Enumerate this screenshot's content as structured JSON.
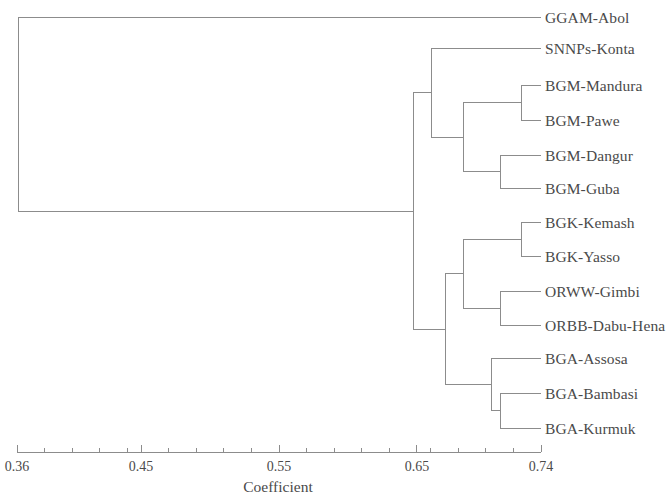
{
  "chart_data": {
    "type": "dendrogram",
    "title": "",
    "xlabel": "Coefficient",
    "ylabel": "",
    "xlim": [
      0.36,
      0.74
    ],
    "grid": false,
    "legend": null,
    "axis": {
      "tick_labels": [
        "0.36",
        "0.45",
        "0.55",
        "0.65",
        "0.74"
      ],
      "tick_values": [
        0.36,
        0.45,
        0.55,
        0.65,
        0.74
      ],
      "minor_tick_values": [
        0.38,
        0.4,
        0.42,
        0.44,
        0.47,
        0.49,
        0.51,
        0.53,
        0.57,
        0.59,
        0.61,
        0.63,
        0.66,
        0.68,
        0.7,
        0.72
      ],
      "orientation": "bottom",
      "direction": "left-to-right-increasing"
    },
    "leaves": [
      {
        "label": "GGAM-Abol",
        "row": 0,
        "tip_coefficient": 0.74
      },
      {
        "label": "SNNPs-Konta",
        "row": 1,
        "tip_coefficient": 0.74
      },
      {
        "label": "BGM-Mandura",
        "row": 2,
        "tip_coefficient": 0.74
      },
      {
        "label": "BGM-Pawe",
        "row": 3,
        "tip_coefficient": 0.74
      },
      {
        "label": "BGM-Dangur",
        "row": 4,
        "tip_coefficient": 0.74
      },
      {
        "label": "BGM-Guba",
        "row": 5,
        "tip_coefficient": 0.74
      },
      {
        "label": "BGK-Kemash",
        "row": 6,
        "tip_coefficient": 0.74
      },
      {
        "label": "BGK-Yasso",
        "row": 7,
        "tip_coefficient": 0.74
      },
      {
        "label": "ORWW-Gimbi",
        "row": 8,
        "tip_coefficient": 0.74
      },
      {
        "label": "ORBB-Dabu-Hena",
        "row": 9,
        "tip_coefficient": 0.74
      },
      {
        "label": "BGA-Assosa",
        "row": 10,
        "tip_coefficient": 0.74
      },
      {
        "label": "BGA-Bambasi",
        "row": 11,
        "tip_coefficient": 0.74
      },
      {
        "label": "BGA-Kurmuk",
        "row": 12,
        "tip_coefficient": 0.74
      }
    ],
    "merges": [
      {
        "id": "n1",
        "coefficient": 0.736,
        "children": [
          "BGM-Mandura",
          "BGM-Pawe"
        ]
      },
      {
        "id": "n2",
        "coefficient": 0.729,
        "children": [
          "BGM-Dangur",
          "BGM-Guba"
        ]
      },
      {
        "id": "n3",
        "coefficient": 0.696,
        "children": [
          "n1",
          "n2"
        ]
      },
      {
        "id": "n4",
        "coefficient": 0.673,
        "children": [
          "SNNPs-Konta",
          "n3"
        ]
      },
      {
        "id": "n5",
        "coefficient": 0.74,
        "children": [
          "BGK-Kemash",
          "BGK-Yasso"
        ]
      },
      {
        "id": "n6",
        "coefficient": 0.696,
        "children": [
          "ORWW-Gimbi",
          "ORBB-Dabu-Hena"
        ]
      },
      {
        "id": "n7",
        "coefficient": 0.679,
        "children": [
          "n5",
          "n6"
        ]
      },
      {
        "id": "n8",
        "coefficient": 0.726,
        "children": [
          "BGA-Bambasi",
          "BGA-Kurmuk"
        ]
      },
      {
        "id": "n9",
        "coefficient": 0.72,
        "children": [
          "BGA-Assosa",
          "n8"
        ]
      },
      {
        "id": "n10",
        "coefficient": 0.647,
        "children": [
          "n7",
          "n9"
        ]
      },
      {
        "id": "n11",
        "coefficient": 0.638,
        "children": [
          "n4",
          "n10"
        ]
      },
      {
        "id": "n12",
        "coefficient": 0.36,
        "children": [
          "GGAM-Abol",
          "n11"
        ]
      }
    ]
  },
  "geometry": {
    "axis_x_start": 17,
    "axis_x_end": 541,
    "axis_y": 452,
    "leaf_row_y": [
      17,
      48,
      85,
      120,
      155,
      188,
      222,
      256,
      291,
      325,
      358,
      393,
      428
    ],
    "label_x": 541,
    "node_x": {
      "n1": 521,
      "n2": 500,
      "n3": 463,
      "n4": 431,
      "n5": 521,
      "n6": 500,
      "n7": 463,
      "n8": 500,
      "n9": 491,
      "n10": 445,
      "n11": 413,
      "n12": 18
    },
    "node_y": {
      "n1": 102.5,
      "n2": 171.5,
      "n3": 137,
      "n4": 92.5,
      "n5": 239,
      "n6": 308,
      "n7": 273.5,
      "n8": 410.5,
      "n9": 384.25,
      "n10": 329,
      "n11": 211,
      "n12": 222.5
    },
    "tick_y_top": 452,
    "tick_major_len": 7,
    "tick_minor_len": 4,
    "tick_label_y": 460,
    "axis_title_y": 479,
    "axis_title_x": 278
  },
  "style": {
    "line_color": "#8c8c8c",
    "axis_color": "#8c8c8c",
    "text_color": "#4a4a4a",
    "background": "#ffffff",
    "line_width": 1
  }
}
